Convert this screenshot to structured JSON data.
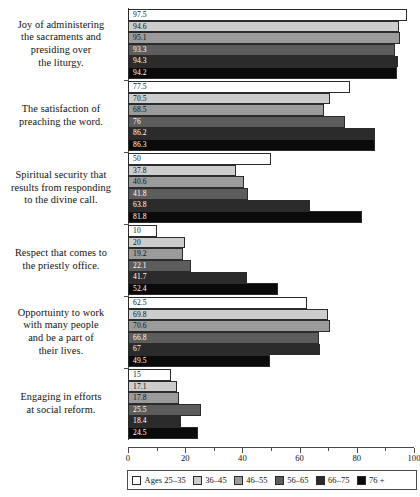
{
  "chart_data": {
    "type": "bar",
    "orientation": "horizontal",
    "title": "",
    "subtitle": "",
    "xlabel": "",
    "ylabel": "",
    "xlim": [
      0,
      100
    ],
    "xticks": [
      0,
      20,
      40,
      60,
      80,
      100
    ],
    "xtick_labels": [
      "0",
      "20",
      "40",
      "60",
      "80",
      "100"
    ],
    "minor_xticks": [
      10,
      30,
      50,
      70,
      90
    ],
    "grid": false,
    "legend_position": "bottom",
    "categories": [
      "Joy of administering the sacraments and presiding over the liturgy.",
      "The satisfaction of preaching the word.",
      "Spiritual security that results from responding to the divine call.",
      "Respect that comes to the priestly office.",
      "Opportuinty to work with many people and be a part of their lives.",
      "Engaging in efforts at social reform."
    ],
    "category_lines": [
      [
        "Joy of administering",
        "the sacraments and",
        "presiding over",
        "the liturgy."
      ],
      [
        "The satisfaction of",
        "preaching the word."
      ],
      [
        "Spiritual security that",
        "results from responding",
        "to the divine call."
      ],
      [
        "Respect that comes to",
        "the priestly office."
      ],
      [
        "Opportuinty to work",
        "with many people",
        "and be a part of",
        "their lives."
      ],
      [
        "Engaging in efforts",
        "at social reform."
      ]
    ],
    "series": [
      {
        "name": "Ages 25–35",
        "color": "#ffffff",
        "text_on_bar": "dark",
        "values": [
          97.5,
          77.5,
          50,
          10,
          62.5,
          15
        ]
      },
      {
        "name": "36–45",
        "color": "#cdcdcd",
        "text_on_bar": "dark",
        "values": [
          94.6,
          70.5,
          37.8,
          20,
          69.8,
          17.1
        ]
      },
      {
        "name": "46–55",
        "color": "#9b9b9b",
        "text_on_bar": "dark",
        "values": [
          95.1,
          68.5,
          40.6,
          19.2,
          70.6,
          17.8
        ]
      },
      {
        "name": "56–65",
        "color": "#5d5d5d",
        "text_on_bar": "light",
        "values": [
          93.3,
          76,
          41.8,
          22.1,
          66.8,
          25.5
        ]
      },
      {
        "name": "66–75",
        "color": "#2b2b2b",
        "text_on_bar": "light",
        "values": [
          94.3,
          86.2,
          63.8,
          41.7,
          67,
          18.4
        ]
      },
      {
        "name": "76 +",
        "color": "#0a0a0a",
        "text_on_bar": "light",
        "values": [
          94.2,
          86.3,
          81.8,
          52.4,
          49.5,
          24.5
        ]
      }
    ],
    "value_labels": [
      [
        "97.5",
        "94.6",
        "95.1",
        "93.3",
        "94.3",
        "94.2"
      ],
      [
        "77.5",
        "70.5",
        "68.5",
        "76",
        "86.2",
        "86.3"
      ],
      [
        "50",
        "37.8",
        "40.6",
        "41.8",
        "63.8",
        "81.8"
      ],
      [
        "10",
        "20",
        "19.2",
        "22.1",
        "41.7",
        "52.4"
      ],
      [
        "62.5",
        "69.8",
        "70.6",
        "66.8",
        "67",
        "49.5"
      ],
      [
        "15",
        "17.1",
        "17.8",
        "25.5",
        "18.4",
        "24.5"
      ]
    ]
  },
  "legend": {
    "items": [
      {
        "label": "Ages 25–35",
        "color": "#ffffff"
      },
      {
        "label": "36–45",
        "color": "#cdcdcd"
      },
      {
        "label": "46–55",
        "color": "#9b9b9b"
      },
      {
        "label": "56–65",
        "color": "#5d5d5d"
      },
      {
        "label": "66–75",
        "color": "#2b2b2b"
      },
      {
        "label": "76 +",
        "color": "#0a0a0a"
      }
    ]
  }
}
